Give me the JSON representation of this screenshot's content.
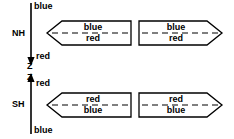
{
  "diagram": {
    "colors": {
      "stroke": "#000000",
      "fill": "#ffffff",
      "text": "#000000"
    },
    "axis": {
      "name": "Z",
      "top_label": "blue",
      "upper_mid_label": "red",
      "lower_mid_label": "red",
      "bottom_label": "blue",
      "z_upper": "Z",
      "z_lower": "Z"
    },
    "hemispheres": [
      {
        "key": "nh",
        "label": "NH"
      },
      {
        "key": "sh",
        "label": "SH"
      }
    ],
    "arrows": [
      {
        "id": "nh-left",
        "row": "NH",
        "direction": "left",
        "top_label": "blue",
        "bottom_label": "red"
      },
      {
        "id": "nh-right",
        "row": "NH",
        "direction": "right",
        "top_label": "blue",
        "bottom_label": "red"
      },
      {
        "id": "sh-left",
        "row": "SH",
        "direction": "left",
        "top_label": "red",
        "bottom_label": "blue"
      },
      {
        "id": "sh-right",
        "row": "SH",
        "direction": "right",
        "top_label": "red",
        "bottom_label": "blue"
      }
    ]
  }
}
